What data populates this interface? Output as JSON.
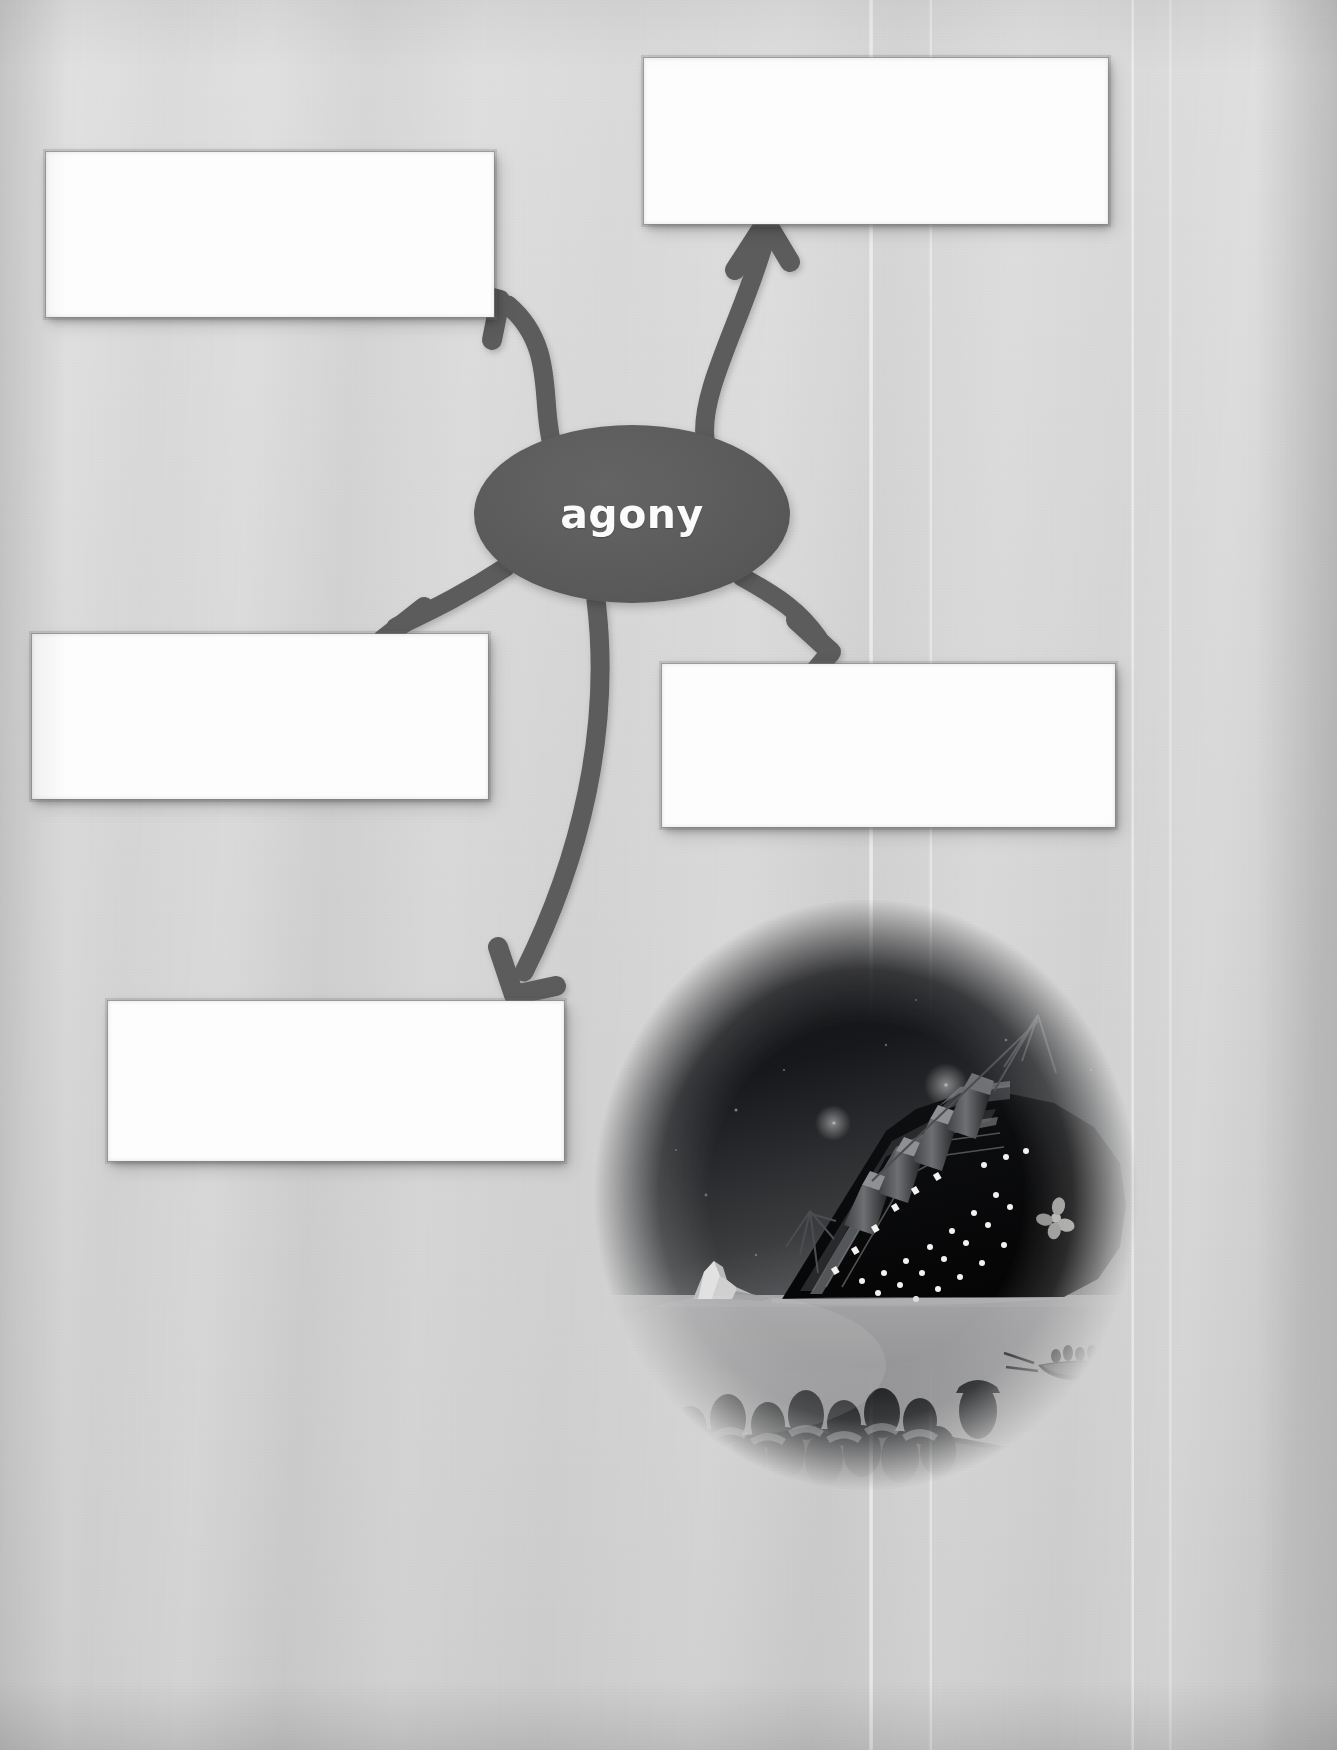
{
  "worksheet": {
    "type": "vocabulary-word-map",
    "background_color": "#d5d5d5",
    "node_color": "#5a5a5a",
    "arrow_color": "#5c5c5c",
    "box_color": "#fdfdfd"
  },
  "center": {
    "word": "agony",
    "shape": "ellipse",
    "text_color": "#fbfbfb"
  },
  "boxes": [
    {
      "id": "box-top-left",
      "value": "",
      "placeholder": ""
    },
    {
      "id": "box-top-right",
      "value": "",
      "placeholder": ""
    },
    {
      "id": "box-mid-left",
      "value": "",
      "placeholder": ""
    },
    {
      "id": "box-mid-right",
      "value": "",
      "placeholder": ""
    },
    {
      "id": "box-bottom-left",
      "value": "",
      "placeholder": ""
    }
  ],
  "arrows": [
    {
      "id": "arrow-to-top-left",
      "from": "center",
      "to": "box-top-left",
      "direction": "up-left"
    },
    {
      "id": "arrow-to-top-right",
      "from": "center",
      "to": "box-top-right",
      "direction": "up-right"
    },
    {
      "id": "arrow-to-mid-left",
      "from": "center",
      "to": "box-mid-left",
      "direction": "down-left"
    },
    {
      "id": "arrow-to-mid-right",
      "from": "center",
      "to": "box-mid-right",
      "direction": "down-right"
    },
    {
      "id": "arrow-to-bottom-left",
      "from": "center",
      "to": "box-bottom-left",
      "direction": "down"
    }
  ],
  "illustration": {
    "name": "titanic-sinking-illustration",
    "caption": "",
    "elements": [
      "night-sky",
      "stars",
      "iceberg",
      "sinking-ocean-liner",
      "four-funnels",
      "lit-portholes",
      "propeller",
      "crowded-lifeboat",
      "distant-lifeboat",
      "ocean-horizon"
    ],
    "vignette_shape": "oval",
    "sky_color": "#070709",
    "sea_color": "#8d8d8d"
  }
}
